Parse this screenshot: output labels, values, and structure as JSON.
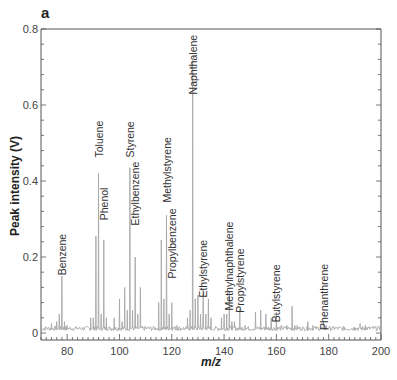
{
  "panel_label": "a",
  "chart_data": {
    "type": "line",
    "title": "",
    "panel_label": "a",
    "xlabel": "m/z",
    "ylabel": "Peak intensity (V)",
    "xlim": [
      70,
      200
    ],
    "ylim": [
      0,
      0.8
    ],
    "x_ticks": [
      80,
      100,
      120,
      140,
      160,
      180,
      200
    ],
    "x_tick_labels": [
      "80",
      "100",
      "120",
      "140",
      "160",
      "180",
      "200"
    ],
    "x_minor_step": 2,
    "y_ticks": [
      0,
      0.2,
      0.4,
      0.6,
      0.8
    ],
    "y_tick_labels": [
      "0",
      "0.2",
      "0.4",
      "0.6",
      "0.8"
    ],
    "y_minor_step": 0.04,
    "grid": false,
    "legend": null,
    "baseline": 0.012,
    "line_color": "#a8a8a8",
    "axis_color": "#555555",
    "peaks": [
      {
        "x": 74,
        "y": 0.025
      },
      {
        "x": 76,
        "y": 0.03
      },
      {
        "x": 77,
        "y": 0.05
      },
      {
        "x": 78,
        "y": 0.15
      },
      {
        "x": 79,
        "y": 0.03
      },
      {
        "x": 80,
        "y": 0.02
      },
      {
        "x": 89,
        "y": 0.04
      },
      {
        "x": 90,
        "y": 0.04
      },
      {
        "x": 91,
        "y": 0.255
      },
      {
        "x": 92,
        "y": 0.42
      },
      {
        "x": 93,
        "y": 0.05
      },
      {
        "x": 94,
        "y": 0.245
      },
      {
        "x": 95,
        "y": 0.04
      },
      {
        "x": 98,
        "y": 0.04
      },
      {
        "x": 100,
        "y": 0.09
      },
      {
        "x": 101,
        "y": 0.03
      },
      {
        "x": 102,
        "y": 0.12
      },
      {
        "x": 103,
        "y": 0.06
      },
      {
        "x": 104,
        "y": 0.435
      },
      {
        "x": 105,
        "y": 0.06
      },
      {
        "x": 106,
        "y": 0.2
      },
      {
        "x": 107,
        "y": 0.05
      },
      {
        "x": 108,
        "y": 0.12
      },
      {
        "x": 115,
        "y": 0.08
      },
      {
        "x": 116,
        "y": 0.245
      },
      {
        "x": 117,
        "y": 0.09
      },
      {
        "x": 118,
        "y": 0.31
      },
      {
        "x": 119,
        "y": 0.05
      },
      {
        "x": 120,
        "y": 0.08
      },
      {
        "x": 122,
        "y": 0.02
      },
      {
        "x": 126,
        "y": 0.04
      },
      {
        "x": 127,
        "y": 0.06
      },
      {
        "x": 128,
        "y": 0.72
      },
      {
        "x": 129,
        "y": 0.09
      },
      {
        "x": 130,
        "y": 0.1
      },
      {
        "x": 131,
        "y": 0.05
      },
      {
        "x": 132,
        "y": 0.113
      },
      {
        "x": 133,
        "y": 0.05
      },
      {
        "x": 134,
        "y": 0.09
      },
      {
        "x": 135,
        "y": 0.04
      },
      {
        "x": 139,
        "y": 0.04
      },
      {
        "x": 140,
        "y": 0.05
      },
      {
        "x": 141,
        "y": 0.05
      },
      {
        "x": 142,
        "y": 0.11
      },
      {
        "x": 143,
        "y": 0.03
      },
      {
        "x": 144,
        "y": 0.03
      },
      {
        "x": 146,
        "y": 0.063
      },
      {
        "x": 148,
        "y": 0.02
      },
      {
        "x": 152,
        "y": 0.055
      },
      {
        "x": 154,
        "y": 0.06
      },
      {
        "x": 156,
        "y": 0.05
      },
      {
        "x": 158,
        "y": 0.04
      },
      {
        "x": 160,
        "y": 0.055
      },
      {
        "x": 162,
        "y": 0.02
      },
      {
        "x": 164,
        "y": 0.02
      },
      {
        "x": 166,
        "y": 0.07
      },
      {
        "x": 167,
        "y": 0.02
      },
      {
        "x": 168,
        "y": 0.02
      },
      {
        "x": 172,
        "y": 0.03
      },
      {
        "x": 174,
        "y": 0.02
      },
      {
        "x": 178,
        "y": 0.03
      },
      {
        "x": 179,
        "y": 0.02
      },
      {
        "x": 182,
        "y": 0.015
      },
      {
        "x": 186,
        "y": 0.015
      },
      {
        "x": 190,
        "y": 0.015
      },
      {
        "x": 192,
        "y": 0.025
      },
      {
        "x": 194,
        "y": 0.02
      },
      {
        "x": 197,
        "y": 0.015
      }
    ],
    "annotations": [
      {
        "label": "Benzene",
        "x": 78,
        "y": 0.15,
        "label_top_y": 0.255
      },
      {
        "label": "Toluene",
        "x": 92,
        "y": 0.42,
        "label_top_y": 0.565
      },
      {
        "label": "Phenol",
        "x": 94,
        "y": 0.245,
        "label_top_y": 0.385
      },
      {
        "label": "Styrene",
        "x": 104,
        "y": 0.435,
        "label_top_y": 0.565
      },
      {
        "label": "Ethylbenzene",
        "x": 106,
        "y": 0.2,
        "label_top_y": 0.46
      },
      {
        "label": "Methylstyrene",
        "x": 118,
        "y": 0.31,
        "label_top_y": 0.535
      },
      {
        "label": "Propylbenzene",
        "x": 120,
        "y": 0.08,
        "label_top_y": 0.335
      },
      {
        "label": "Naphthalene",
        "x": 128,
        "y": 0.72,
        "label_top_y": 0.79
      },
      {
        "label": "Ethylstyrene",
        "x": 132,
        "y": 0.113,
        "label_top_y": 0.27
      },
      {
        "label": "Methylnaphthalene",
        "x": 142,
        "y": 0.11,
        "label_top_y": 0.31
      },
      {
        "label": "Propylstyrene",
        "x": 146,
        "y": 0.063,
        "label_top_y": 0.245
      },
      {
        "label": "Butylstyrene",
        "x": 160,
        "y": 0.055,
        "label_top_y": 0.205
      },
      {
        "label": "Phenanthrene",
        "x": 178,
        "y": 0.03,
        "label_top_y": 0.185
      }
    ]
  }
}
